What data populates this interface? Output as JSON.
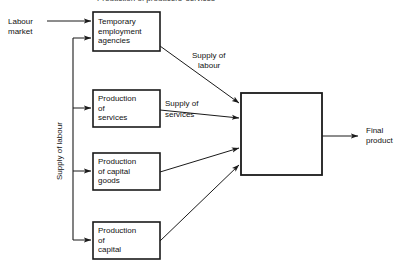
{
  "figure": {
    "title_partial": "Production of producers' services",
    "background_color": "#ffffff",
    "line_color": "#1a1a1a",
    "text_color": "#111111"
  },
  "source_node": {
    "label_line1": "Labour",
    "label_line2": "market"
  },
  "trunk_label": "Supply of labour",
  "nodes": [
    {
      "id": "temporary-employment-agencies",
      "line1": "Temporary",
      "line2": "employment",
      "line3": "agencies"
    },
    {
      "id": "production-of-services",
      "line1": "Production",
      "line2": "of",
      "line3": "services"
    },
    {
      "id": "production-of-capital-goods",
      "line1": "Production",
      "line2": "of capital",
      "line3": "goods"
    },
    {
      "id": "production-of-capital",
      "line1": "Production",
      "line2": "of",
      "line3": "capital"
    }
  ],
  "hub": {
    "id": "production-process",
    "label": ""
  },
  "edge_labels": {
    "supply_of_labour_line1": "Supply of",
    "supply_of_labour_line2": "labour",
    "supply_of_services_line1": "Supply of",
    "supply_of_services_line2": "services"
  },
  "output": {
    "line1": "Final",
    "line2": "product"
  }
}
